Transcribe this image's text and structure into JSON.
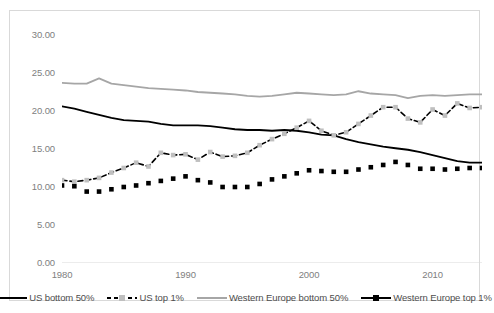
{
  "chart_data": {
    "type": "line",
    "title": "",
    "xlabel": "",
    "ylabel": "",
    "xlim": [
      1980,
      2014
    ],
    "ylim": [
      0,
      30
    ],
    "ytick_labels": [
      "0.00",
      "5.00",
      "10.00",
      "15.00",
      "20.00",
      "25.00",
      "30.00"
    ],
    "ytick_values": [
      0,
      5,
      10,
      15,
      20,
      25,
      30
    ],
    "xtick_labels": [
      "1980",
      "1990",
      "2000",
      "2010"
    ],
    "xtick_values": [
      1980,
      1990,
      2000,
      2010
    ],
    "grid": false,
    "legend_position": "bottom",
    "x": [
      1980,
      1981,
      1982,
      1983,
      1984,
      1985,
      1986,
      1987,
      1988,
      1989,
      1990,
      1991,
      1992,
      1993,
      1994,
      1995,
      1996,
      1997,
      1998,
      1999,
      2000,
      2001,
      2002,
      2003,
      2004,
      2005,
      2006,
      2007,
      2008,
      2009,
      2010,
      2011,
      2012,
      2013,
      2014
    ],
    "series": [
      {
        "name": "US bottom 50%",
        "color": "#000000",
        "line_style": "solid",
        "marker": "none",
        "values": [
          20.6,
          20.3,
          19.9,
          19.5,
          19.1,
          18.8,
          18.7,
          18.6,
          18.3,
          18.1,
          18.1,
          18.1,
          18.0,
          17.8,
          17.6,
          17.5,
          17.5,
          17.4,
          17.5,
          17.4,
          17.2,
          16.9,
          16.8,
          16.3,
          15.9,
          15.6,
          15.3,
          15.1,
          14.9,
          14.6,
          14.2,
          13.8,
          13.4,
          13.2,
          13.2
        ]
      },
      {
        "name": "US top 1%",
        "color": "#000000",
        "marker_color": "#bfbfbf",
        "line_style": "dashed",
        "marker": "square",
        "values": [
          10.9,
          10.7,
          10.9,
          11.2,
          11.9,
          12.5,
          13.2,
          12.7,
          14.5,
          14.2,
          14.3,
          13.6,
          14.6,
          14.0,
          14.1,
          14.5,
          15.5,
          16.3,
          17.0,
          17.8,
          18.7,
          17.4,
          16.8,
          17.2,
          18.3,
          19.4,
          20.5,
          20.5,
          19.0,
          18.5,
          20.2,
          19.4,
          21.0,
          20.4,
          20.5
        ]
      },
      {
        "name": "Western Europe bottom 50%",
        "color": "#a6a6a6",
        "line_style": "solid",
        "marker": "none",
        "values": [
          23.7,
          23.6,
          23.6,
          24.3,
          23.6,
          23.4,
          23.2,
          23.0,
          22.9,
          22.8,
          22.7,
          22.5,
          22.4,
          22.3,
          22.2,
          22.0,
          21.9,
          22.0,
          22.2,
          22.4,
          22.3,
          22.2,
          22.1,
          22.2,
          22.6,
          22.3,
          22.2,
          22.1,
          21.7,
          22.0,
          22.1,
          22.0,
          22.1,
          22.2,
          22.2
        ]
      },
      {
        "name": "Western Europe top 1%",
        "color": "#000000",
        "marker_color": "#000000",
        "line_style": "dotted-marker",
        "marker": "square",
        "values": [
          10.2,
          10.1,
          9.4,
          9.4,
          9.7,
          10.0,
          10.2,
          10.5,
          10.8,
          11.1,
          11.4,
          10.9,
          10.6,
          10.0,
          10.0,
          10.0,
          10.4,
          11.0,
          11.4,
          11.8,
          12.2,
          12.1,
          12.0,
          12.0,
          12.3,
          12.6,
          12.9,
          13.3,
          12.9,
          12.4,
          12.4,
          12.3,
          12.4,
          12.5,
          12.5
        ]
      }
    ]
  },
  "legend": {
    "items": [
      {
        "label": "US bottom 50%"
      },
      {
        "label": "US top 1%"
      },
      {
        "label": "Western Europe bottom 50%"
      },
      {
        "label": "Western Europe top 1%"
      }
    ]
  }
}
